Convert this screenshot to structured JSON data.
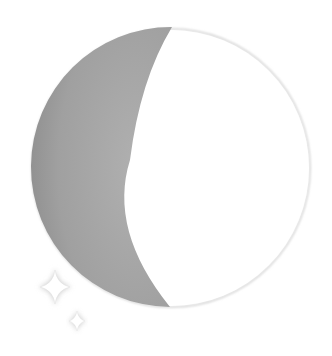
{
  "illustration": {
    "subject": "moon-phase",
    "phase": "waxing-gibbous",
    "colors": {
      "background": "#ffffff",
      "shadow": "#a3a3a3",
      "shadow_edge": "#8a8a8a",
      "lit": "#ffffff",
      "outline": "#d8d8d8",
      "sparkle": "#ffffff",
      "sparkle_glow": "#cfcfcf"
    },
    "icons": [
      "moon-icon",
      "sparkle-icon",
      "sparkle-icon"
    ]
  }
}
